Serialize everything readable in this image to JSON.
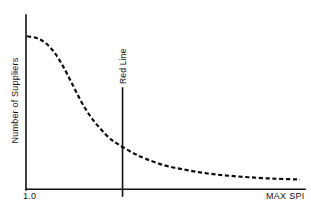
{
  "chart_data": {
    "type": "line",
    "title": "",
    "subtitle": "",
    "xlabel": "MAX SPI",
    "ylabel": "Number of Suppliers",
    "xlim": [
      1.0,
      4.0
    ],
    "ylim": [
      0,
      100
    ],
    "grid": false,
    "legend": null,
    "xtick_labels": [
      "1.0",
      "MAX SPI"
    ],
    "ytick_labels": [],
    "series": [
      {
        "name": "Supplier distribution",
        "style": "dashed",
        "color": "#0d0d0d",
        "x": [
          1.0,
          1.1,
          1.2,
          1.3,
          1.4,
          1.5,
          1.6,
          1.7,
          1.8,
          1.9,
          2.0,
          2.15,
          2.3,
          2.5,
          2.7,
          2.9,
          3.1,
          3.3,
          3.5,
          3.7,
          3.9,
          4.0
        ],
        "y": [
          93,
          92,
          89,
          83,
          74,
          63,
          52,
          43,
          36,
          30,
          26,
          21,
          17,
          13,
          10.5,
          8.5,
          7,
          6,
          5.2,
          4.6,
          4.2,
          4.0
        ]
      }
    ],
    "annotations": [
      {
        "name": "red-line",
        "label": "Red Line",
        "type": "vertical-line",
        "x": 2.05,
        "orientation": "rotated-90",
        "color": "#111111"
      }
    ]
  },
  "axes": {
    "y_axis_label": "Number of Suppliers",
    "x_tick_min": "1.0",
    "x_tick_max": "MAX SPI"
  },
  "annotation": {
    "red_line_label": "Red Line"
  },
  "colors": {
    "background": "#ffffff",
    "ink": "#111111",
    "curve": "#0d0d0d"
  }
}
